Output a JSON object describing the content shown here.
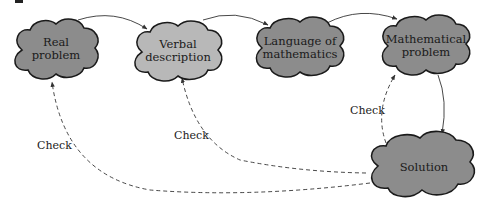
{
  "diagram": {
    "nodes": [
      {
        "id": "real",
        "line1": "Real",
        "line2": "problem",
        "fill": "#8c8c8c"
      },
      {
        "id": "verbal",
        "line1": "Verbal",
        "line2": "description",
        "fill": "#b8b8b8"
      },
      {
        "id": "language",
        "line1": "Language of",
        "line2": "mathematics",
        "fill": "#8c8c8c"
      },
      {
        "id": "math",
        "line1": "Mathematical",
        "line2": "problem",
        "fill": "#8c8c8c"
      },
      {
        "id": "solution",
        "line1": "Solution",
        "line2": "",
        "fill": "#8c8c8c"
      }
    ],
    "edges": [
      {
        "from": "real",
        "to": "verbal",
        "style": "solid"
      },
      {
        "from": "verbal",
        "to": "language",
        "style": "solid"
      },
      {
        "from": "language",
        "to": "math",
        "style": "solid"
      },
      {
        "from": "math",
        "to": "solution",
        "style": "solid"
      },
      {
        "from": "solution",
        "to": "math",
        "style": "dashed",
        "label": "Check"
      },
      {
        "from": "solution",
        "to": "verbal",
        "style": "dashed",
        "label": "Check"
      },
      {
        "from": "solution",
        "to": "real",
        "style": "dashed",
        "label": "Check"
      }
    ],
    "check_labels": [
      "Check",
      "Check",
      "Check"
    ]
  }
}
